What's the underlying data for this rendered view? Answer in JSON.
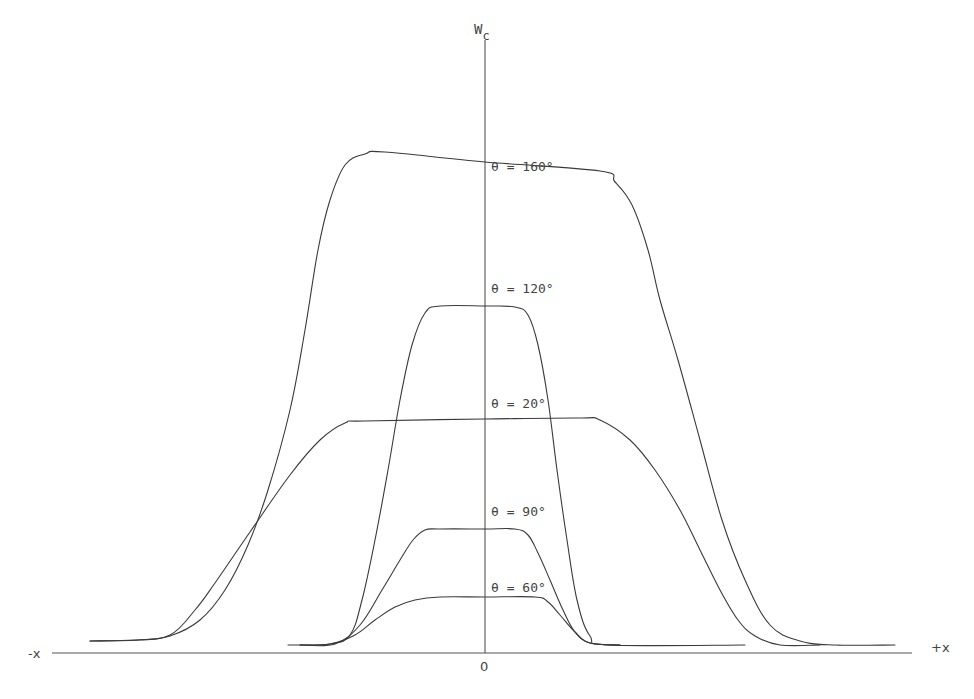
{
  "chart_data": {
    "type": "line",
    "title": "",
    "xlabel_negative": "-x",
    "xlabel_positive": "+x",
    "ylabel": "W",
    "ylabel_sub": "c",
    "origin_label": "0",
    "grid": false,
    "legend_position": "inline labels near curve plateaus",
    "axes_px": {
      "y_axis_x": 485,
      "x_axis_y": 653,
      "y_axis_top": 40,
      "x_axis_left": 52,
      "x_axis_right": 912
    },
    "series": [
      {
        "name": "θ = 160°",
        "label_pos": [
          491,
          169
        ],
        "points_px": [
          [
            90,
            641
          ],
          [
            140,
            640
          ],
          [
            170,
            636
          ],
          [
            200,
            620
          ],
          [
            225,
            590
          ],
          [
            248,
            545
          ],
          [
            268,
            490
          ],
          [
            290,
            410
          ],
          [
            305,
            330
          ],
          [
            318,
            250
          ],
          [
            330,
            200
          ],
          [
            345,
            165
          ],
          [
            365,
            154
          ],
          [
            385,
            152
          ],
          [
            485,
            162
          ],
          [
            600,
            171
          ],
          [
            615,
            182
          ],
          [
            632,
            205
          ],
          [
            648,
            250
          ],
          [
            660,
            300
          ],
          [
            678,
            360
          ],
          [
            700,
            440
          ],
          [
            722,
            520
          ],
          [
            745,
            580
          ],
          [
            770,
            625
          ],
          [
            800,
            641
          ],
          [
            835,
            645
          ],
          [
            895,
            645
          ]
        ]
      },
      {
        "name": "θ = 120°",
        "label_pos": [
          491,
          291
        ],
        "points_px": [
          [
            288,
            645
          ],
          [
            330,
            644
          ],
          [
            350,
            635
          ],
          [
            362,
            600
          ],
          [
            375,
            540
          ],
          [
            388,
            470
          ],
          [
            400,
            400
          ],
          [
            412,
            345
          ],
          [
            425,
            313
          ],
          [
            440,
            306
          ],
          [
            485,
            306
          ],
          [
            515,
            307
          ],
          [
            528,
            315
          ],
          [
            538,
            345
          ],
          [
            548,
            400
          ],
          [
            557,
            470
          ],
          [
            567,
            540
          ],
          [
            577,
            600
          ],
          [
            590,
            636
          ],
          [
            610,
            645
          ],
          [
            745,
            645
          ]
        ]
      },
      {
        "name": "θ = 20°",
        "label_pos": [
          491,
          406
        ],
        "points_px": [
          [
            90,
            641
          ],
          [
            135,
            640
          ],
          [
            170,
            635
          ],
          [
            195,
            610
          ],
          [
            215,
            583
          ],
          [
            250,
            532
          ],
          [
            290,
            475
          ],
          [
            320,
            440
          ],
          [
            345,
            423
          ],
          [
            365,
            421
          ],
          [
            485,
            419
          ],
          [
            580,
            418
          ],
          [
            600,
            420
          ],
          [
            630,
            440
          ],
          [
            655,
            470
          ],
          [
            680,
            510
          ],
          [
            700,
            550
          ],
          [
            720,
            590
          ],
          [
            738,
            620
          ],
          [
            755,
            636
          ],
          [
            780,
            645
          ],
          [
            820,
            645
          ]
        ]
      },
      {
        "name": "θ = 90°",
        "label_pos": [
          491,
          514
        ],
        "points_px": [
          [
            300,
            645
          ],
          [
            335,
            644
          ],
          [
            360,
            625
          ],
          [
            382,
            590
          ],
          [
            400,
            560
          ],
          [
            413,
            540
          ],
          [
            425,
            530
          ],
          [
            440,
            529
          ],
          [
            485,
            529
          ],
          [
            515,
            529
          ],
          [
            528,
            535
          ],
          [
            538,
            553
          ],
          [
            550,
            580
          ],
          [
            563,
            610
          ],
          [
            575,
            632
          ],
          [
            590,
            643
          ],
          [
            620,
            645
          ]
        ]
      },
      {
        "name": "θ = 60°",
        "label_pos": [
          491,
          590
        ],
        "points_px": [
          [
            300,
            645
          ],
          [
            330,
            644
          ],
          [
            355,
            635
          ],
          [
            375,
            620
          ],
          [
            395,
            607
          ],
          [
            415,
            600
          ],
          [
            440,
            597
          ],
          [
            485,
            597
          ],
          [
            535,
            597
          ],
          [
            548,
            602
          ],
          [
            560,
            615
          ],
          [
            575,
            632
          ],
          [
            590,
            643
          ],
          [
            620,
            645
          ]
        ]
      }
    ]
  }
}
